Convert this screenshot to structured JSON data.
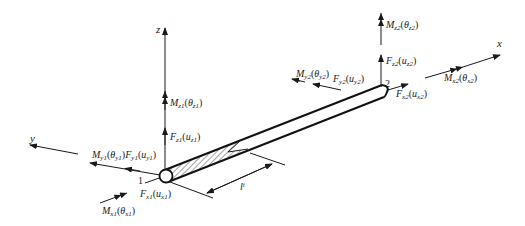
{
  "diagram": {
    "axes": {
      "x": "x",
      "y": "y",
      "z": "z"
    },
    "nodes": {
      "node1": "1",
      "node2": "2"
    },
    "length_label": "l",
    "length_sub": "i",
    "node1_labels": {
      "Mz1": {
        "main": "M",
        "sub": "z1",
        "arg": "θ",
        "argsub": "z1"
      },
      "Fz1": {
        "main": "F",
        "sub": "z1",
        "arg": "u",
        "argsub": "z1"
      },
      "My1": {
        "main": "M",
        "sub": "y1",
        "arg": "θ",
        "argsub": "y1"
      },
      "Fy1": {
        "main": "F",
        "sub": "y1",
        "arg": "u",
        "argsub": "y1"
      },
      "Fx1": {
        "main": "F",
        "sub": "x1",
        "arg": "u",
        "argsub": "x1"
      },
      "Mx1": {
        "main": "M",
        "sub": "x1",
        "arg": "θ",
        "argsub": "x1"
      }
    },
    "node2_labels": {
      "Mz2": {
        "main": "M",
        "sub": "z2",
        "arg": "θ",
        "argsub": "z2"
      },
      "Fz2": {
        "main": "F",
        "sub": "z2",
        "arg": "u",
        "argsub": "z2"
      },
      "My2": {
        "main": "M",
        "sub": "y2",
        "arg": "θ",
        "argsub": "y2"
      },
      "Fy2": {
        "main": "F",
        "sub": "y2",
        "arg": "u",
        "argsub": "y2"
      },
      "Fx2": {
        "main": "F",
        "sub": "x2",
        "arg": "u",
        "argsub": "x2"
      },
      "Mx2": {
        "main": "M",
        "sub": "x2",
        "arg": "θ",
        "argsub": "x2"
      }
    },
    "colors": {
      "line": "#1a1a1a",
      "background": "#ffffff"
    }
  }
}
